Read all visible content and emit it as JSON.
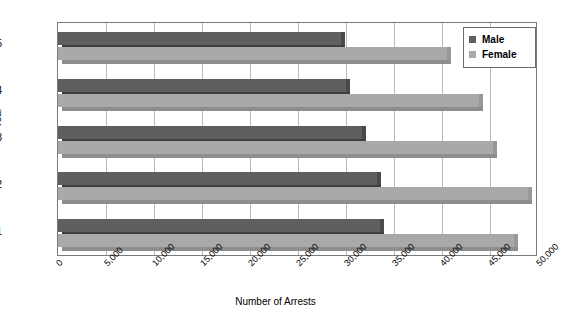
{
  "chart_data": {
    "type": "bar",
    "orientation": "horizontal",
    "title": "",
    "xlabel": "Number of Arrests",
    "ylabel": "Year",
    "categories": [
      "2005",
      "2004",
      "2003",
      "2002",
      "2001"
    ],
    "series": [
      {
        "name": "Male",
        "color": "#5f5f5f",
        "values": [
          29500,
          30000,
          31700,
          33200,
          33500
        ]
      },
      {
        "name": "Female",
        "color": "#a9a9a9",
        "values": [
          40500,
          43900,
          45300,
          49000,
          47500
        ]
      }
    ],
    "xlim": [
      0,
      50000
    ],
    "xticks": [
      0,
      5000,
      10000,
      15000,
      20000,
      25000,
      30000,
      35000,
      40000,
      45000,
      50000
    ],
    "xtick_labels": [
      "0",
      "5,000",
      "10,000",
      "15,000",
      "20,000",
      "25,000",
      "30,000",
      "35,000",
      "40,000",
      "45,000",
      "50,000"
    ],
    "ytick_labels": [
      "2005",
      "2004",
      "2003",
      "2002",
      "2001"
    ],
    "grid": "vertical",
    "legend_position": "top-right",
    "legend_entries": [
      "Male",
      "Female"
    ]
  }
}
